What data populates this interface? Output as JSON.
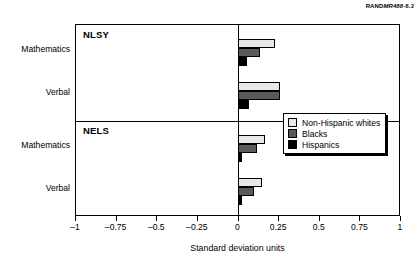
{
  "credit": {
    "prefix": "RAND",
    "italic": "MR488-6.3"
  },
  "chart_data": {
    "type": "bar",
    "orientation": "horizontal",
    "title": "",
    "xlabel": "Standard deviation units",
    "ylabel": "",
    "xlim": [
      -1,
      1
    ],
    "xticks": [
      "–1",
      "–0.75",
      "–0.5",
      "–0.25",
      "0",
      "0.25",
      "0.5",
      "0.75",
      "1"
    ],
    "xtickvalues": [
      -1,
      -0.75,
      -0.5,
      -0.25,
      0,
      0.25,
      0.5,
      0.75,
      1
    ],
    "grid": false,
    "legend_position": "middle-right",
    "panels": [
      {
        "name": "NLSY",
        "categories": [
          "Mathematics",
          "Verbal"
        ],
        "series": [
          {
            "name": "Non-Hispanic whites",
            "color": "#e8e8e8",
            "values": [
              0.23,
              0.26
            ]
          },
          {
            "name": "Blacks",
            "color": "#5a5a5a",
            "values": [
              0.14,
              0.26
            ]
          },
          {
            "name": "Hispanics",
            "color": "#000000",
            "values": [
              0.06,
              0.07
            ]
          }
        ]
      },
      {
        "name": "NELS",
        "categories": [
          "Mathematics",
          "Verbal"
        ],
        "series": [
          {
            "name": "Non-Hispanic whites",
            "color": "#e8e8e8",
            "values": [
              0.17,
              0.15
            ]
          },
          {
            "name": "Blacks",
            "color": "#5a5a5a",
            "values": [
              0.12,
              0.1
            ]
          },
          {
            "name": "Hispanics",
            "color": "#000000",
            "values": [
              0.03,
              0.03
            ]
          }
        ]
      }
    ],
    "legend": [
      {
        "label": "Non-Hispanic whites",
        "color": "#e8e8e8"
      },
      {
        "label": "Blacks",
        "color": "#5a5a5a"
      },
      {
        "label": "Hispanics",
        "color": "#000000"
      }
    ]
  }
}
